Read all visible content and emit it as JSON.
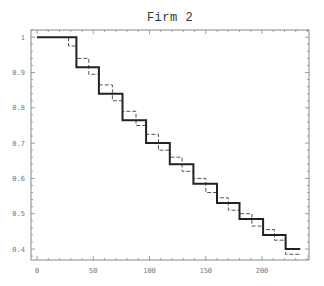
{
  "chart_data": {
    "type": "line",
    "subtype": "step",
    "title": "Firm 2",
    "xlabel": "",
    "ylabel": "",
    "xlim": [
      -5,
      242
    ],
    "ylim": [
      0.37,
      1.017
    ],
    "x_ticks": [
      0,
      50,
      100,
      150,
      200
    ],
    "x_tick_labels": [
      "0",
      "50",
      "100",
      "150",
      "200"
    ],
    "y_ticks": [
      0.4,
      0.5,
      0.6,
      0.7,
      0.8,
      0.9,
      1
    ],
    "y_tick_labels": [
      "0.4",
      "0.5",
      "0.6",
      "0.7",
      "0.8",
      "0.9",
      "1"
    ],
    "grid": false,
    "legend": null,
    "series": [
      {
        "name": "solid",
        "style": "solid",
        "x": [
          0,
          35,
          35,
          55,
          55,
          76,
          76,
          97,
          97,
          118,
          118,
          139,
          139,
          160,
          160,
          180,
          180,
          201,
          201,
          221,
          221,
          234
        ],
        "values": [
          1.0,
          1.0,
          0.915,
          0.915,
          0.84,
          0.84,
          0.765,
          0.765,
          0.7,
          0.7,
          0.64,
          0.64,
          0.585,
          0.585,
          0.53,
          0.53,
          0.485,
          0.485,
          0.44,
          0.44,
          0.4,
          0.4
        ]
      },
      {
        "name": "dashed",
        "style": "dashed",
        "x": [
          28,
          28,
          35,
          35,
          46,
          46,
          55,
          55,
          67,
          67,
          76,
          76,
          88,
          88,
          97,
          97,
          108,
          108,
          118,
          118,
          129,
          129,
          139,
          139,
          150,
          150,
          160,
          160,
          170,
          170,
          180,
          180,
          191,
          191,
          201,
          201,
          211,
          211,
          221,
          221,
          234
        ],
        "values": [
          1.0,
          0.975,
          0.975,
          0.94,
          0.94,
          0.895,
          0.895,
          0.865,
          0.865,
          0.82,
          0.82,
          0.79,
          0.79,
          0.75,
          0.75,
          0.725,
          0.725,
          0.68,
          0.68,
          0.66,
          0.66,
          0.62,
          0.62,
          0.6,
          0.6,
          0.56,
          0.56,
          0.545,
          0.545,
          0.51,
          0.51,
          0.5,
          0.5,
          0.465,
          0.465,
          0.455,
          0.455,
          0.425,
          0.425,
          0.385,
          0.385
        ]
      }
    ]
  }
}
